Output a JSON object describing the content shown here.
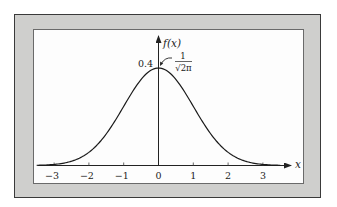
{
  "chart_data": {
    "type": "line",
    "title": "",
    "xlabel": "x",
    "ylabel": "f(x)",
    "series": [
      {
        "name": "standard normal density",
        "x": [
          -3.5,
          -3,
          -2.5,
          -2,
          -1.5,
          -1,
          -0.5,
          0,
          0.5,
          1,
          1.5,
          2,
          2.5,
          3,
          3.5
        ],
        "values": [
          0.0009,
          0.0044,
          0.0175,
          0.054,
          0.1295,
          0.242,
          0.3521,
          0.3989,
          0.3521,
          0.242,
          0.1295,
          0.054,
          0.0175,
          0.0044,
          0.0009
        ]
      }
    ],
    "x_ticks": [
      "−3",
      "−2",
      "−1",
      "0",
      "1",
      "2",
      "3"
    ],
    "x_tick_values": [
      -3,
      -2,
      -1,
      0,
      1,
      2,
      3
    ],
    "y_ticks": [
      "0.4"
    ],
    "y_tick_values": [
      0.4
    ],
    "xlim": [
      -3.5,
      3.6
    ],
    "ylim": [
      0,
      0.55
    ],
    "grid": false,
    "legend": "none",
    "annotations": [
      {
        "text": "1/√(2π)",
        "points_to": "peak at x=0",
        "numerator": "1",
        "denominator": "√2π"
      }
    ]
  },
  "labels": {
    "y_axis": "f(x)",
    "x_axis": "x",
    "peak_value": "0.4",
    "annot_numerator": "1",
    "annot_denominator": "√2π"
  },
  "colors": {
    "mat": "#cfcfcd",
    "frame_border": "#3a3a3a",
    "panel": "#fdfdfd",
    "ink": "#222222"
  }
}
